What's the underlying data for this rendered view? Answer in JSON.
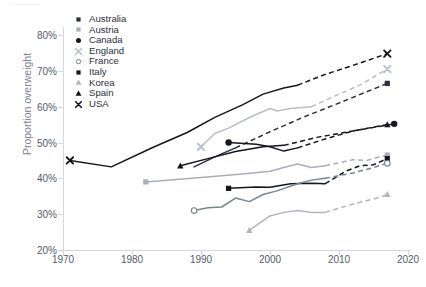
{
  "partial_text_top": "............",
  "axes": {
    "ylabel": "Proportion overweight",
    "yticks": [
      "20%",
      "30%",
      "40%",
      "50%",
      "60%",
      "70%",
      "80%"
    ],
    "xticks": [
      "1970",
      "1980",
      "1990",
      "2000",
      "2010",
      "2020"
    ]
  },
  "legend": [
    {
      "label": "Australia",
      "marker": "square",
      "color": "#2b2f3a"
    },
    {
      "label": "Austria",
      "marker": "square",
      "color": "#a9aeb8"
    },
    {
      "label": "Canada",
      "marker": "circle",
      "color": "#16181d"
    },
    {
      "label": "England",
      "marker": "x",
      "color": "#b9bec8"
    },
    {
      "label": "France",
      "marker": "circle-open",
      "color": "#7b8290"
    },
    {
      "label": "Italy",
      "marker": "square",
      "color": "#14161b"
    },
    {
      "label": "Korea",
      "marker": "triangle",
      "color": "#b0b5bf"
    },
    {
      "label": "Spain",
      "marker": "triangle",
      "color": "#14161b"
    },
    {
      "label": "USA",
      "marker": "x",
      "color": "#14161b"
    }
  ],
  "chart_data": {
    "type": "line",
    "title": "",
    "xlabel": "",
    "ylabel": "Proportion overweight",
    "xlim": [
      1970,
      2020
    ],
    "ylim": [
      20,
      80
    ],
    "grid": false,
    "legend_position": "top-left-inside",
    "y_unit": "percent",
    "note": "Solid segments are observed data; dashed segments are projections.",
    "series": [
      {
        "name": "USA",
        "color": "#14161b",
        "marker": "x",
        "marker_points": [
          [
            1971,
            45.0
          ],
          [
            2017,
            74.8
          ]
        ],
        "solid": [
          [
            1971,
            45.0
          ],
          [
            1977,
            43.2
          ],
          [
            1983,
            48.6
          ],
          [
            1988,
            52.8
          ],
          [
            1992,
            57.0
          ],
          [
            1996,
            60.5
          ],
          [
            1999,
            63.5
          ],
          [
            2002,
            65.2
          ],
          [
            2004,
            66.0
          ]
        ],
        "dashed": [
          [
            2004,
            66.0
          ],
          [
            2008,
            69.0
          ],
          [
            2012,
            71.5
          ],
          [
            2017,
            74.8
          ]
        ]
      },
      {
        "name": "England",
        "color": "#b9bec8",
        "marker": "x",
        "marker_points": [
          [
            1990,
            48.8
          ],
          [
            2017,
            70.5
          ]
        ],
        "solid": [
          [
            1990,
            48.8
          ],
          [
            1992,
            52.5
          ],
          [
            1994,
            54.0
          ],
          [
            1996,
            56.0
          ],
          [
            1998,
            57.8
          ],
          [
            2000,
            59.5
          ],
          [
            2001,
            58.8
          ],
          [
            2003,
            59.5
          ],
          [
            2006,
            60.0
          ]
        ],
        "dashed": [
          [
            2006,
            60.0
          ],
          [
            2010,
            63.5
          ],
          [
            2013,
            66.0
          ],
          [
            2017,
            70.5
          ]
        ]
      },
      {
        "name": "Australia",
        "color": "#2b2f3a",
        "marker": "square",
        "marker_points": [
          [
            2017,
            66.5
          ]
        ],
        "solid": [
          [
            1989,
            43.2
          ],
          [
            1992,
            46.0
          ],
          [
            1995,
            48.5
          ]
        ],
        "dashed": [
          [
            1995,
            48.5
          ],
          [
            2000,
            53.0
          ],
          [
            2005,
            57.2
          ],
          [
            2010,
            61.0
          ],
          [
            2017,
            66.5
          ]
        ]
      },
      {
        "name": "Canada",
        "color": "#16181d",
        "marker": "circle",
        "marker_points": [
          [
            1994,
            50.0
          ],
          [
            2018,
            55.2
          ]
        ],
        "solid": [
          [
            1994,
            50.0
          ],
          [
            1998,
            49.5
          ],
          [
            2000,
            48.8
          ],
          [
            2002,
            47.6
          ],
          [
            2004,
            48.5
          ]
        ],
        "dashed": [
          [
            2004,
            48.5
          ],
          [
            2008,
            51.0
          ],
          [
            2012,
            53.2
          ],
          [
            2018,
            55.2
          ]
        ]
      },
      {
        "name": "Spain",
        "color": "#14161b",
        "marker": "triangle",
        "marker_points": [
          [
            1987,
            43.5
          ],
          [
            2017,
            55.0
          ]
        ],
        "solid": [
          [
            1987,
            43.5
          ],
          [
            1991,
            45.5
          ],
          [
            1995,
            47.5
          ],
          [
            1999,
            48.8
          ],
          [
            2002,
            49.2
          ]
        ],
        "dashed": [
          [
            2002,
            49.2
          ],
          [
            2007,
            51.5
          ],
          [
            2012,
            53.2
          ],
          [
            2017,
            55.0
          ]
        ]
      },
      {
        "name": "Austria",
        "color": "#a9aeb8",
        "marker": "square",
        "marker_points": [
          [
            1982,
            39.0
          ],
          [
            2017,
            46.5
          ]
        ],
        "solid": [
          [
            1982,
            39.0
          ],
          [
            1990,
            40.2
          ],
          [
            1996,
            41.2
          ],
          [
            2000,
            42.0
          ],
          [
            2002,
            43.0
          ],
          [
            2004,
            44.0
          ],
          [
            2006,
            43.0
          ],
          [
            2008,
            43.5
          ]
        ],
        "dashed": [
          [
            2008,
            43.5
          ],
          [
            2012,
            45.2
          ],
          [
            2014,
            45.0
          ],
          [
            2017,
            46.5
          ]
        ]
      },
      {
        "name": "Italy",
        "color": "#14161b",
        "marker": "square",
        "marker_points": [
          [
            1994,
            37.2
          ],
          [
            2017,
            45.5
          ]
        ],
        "solid": [
          [
            1994,
            37.2
          ],
          [
            1998,
            37.6
          ],
          [
            2000,
            37.5
          ],
          [
            2003,
            38.5
          ],
          [
            2006,
            38.6
          ],
          [
            2008,
            38.5
          ]
        ],
        "dashed": [
          [
            2008,
            38.5
          ],
          [
            2011,
            42.0
          ],
          [
            2013,
            43.5
          ],
          [
            2015,
            43.8
          ],
          [
            2017,
            45.5
          ]
        ]
      },
      {
        "name": "France",
        "color": "#7b8290",
        "marker": "circle-open",
        "marker_points": [
          [
            1989,
            31.0
          ],
          [
            2017,
            44.2
          ]
        ],
        "solid": [
          [
            1989,
            31.0
          ],
          [
            1991,
            31.8
          ],
          [
            1993,
            32.0
          ],
          [
            1995,
            34.5
          ],
          [
            1997,
            33.5
          ],
          [
            1999,
            35.5
          ],
          [
            2001,
            36.5
          ],
          [
            2004,
            38.5
          ],
          [
            2006,
            39.5
          ],
          [
            2008,
            40.0
          ]
        ],
        "dashed": [
          [
            2008,
            40.0
          ],
          [
            2012,
            41.5
          ],
          [
            2015,
            43.0
          ],
          [
            2017,
            44.2
          ]
        ]
      },
      {
        "name": "Korea",
        "color": "#b0b5bf",
        "marker": "triangle",
        "marker_points": [
          [
            1997,
            25.5
          ],
          [
            2017,
            35.5
          ]
        ],
        "solid": [
          [
            1997,
            25.5
          ],
          [
            2000,
            29.5
          ],
          [
            2002,
            30.5
          ],
          [
            2004,
            31.0
          ],
          [
            2006,
            30.5
          ],
          [
            2008,
            30.5
          ]
        ],
        "dashed": [
          [
            2008,
            30.5
          ],
          [
            2012,
            32.8
          ],
          [
            2015,
            34.2
          ],
          [
            2017,
            35.5
          ]
        ]
      }
    ]
  }
}
